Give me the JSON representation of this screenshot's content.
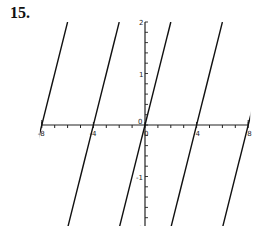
{
  "problem_number": "15.",
  "chart_data": {
    "type": "line",
    "title": "",
    "xlabel": "",
    "ylabel": "",
    "xlim": [
      -8,
      8
    ],
    "ylim": [
      -2,
      2
    ],
    "x_ticks": [
      "-8",
      "-4",
      "0",
      "4",
      "8"
    ],
    "y_ticks": [
      "2",
      "1",
      "-1",
      "-2"
    ],
    "grid": false,
    "series": [
      {
        "name": "segment-1",
        "x": [
          -10,
          -6
        ],
        "y": [
          -2,
          2
        ]
      },
      {
        "name": "segment-2",
        "x": [
          -6,
          -2
        ],
        "y": [
          -2,
          2
        ]
      },
      {
        "name": "segment-3",
        "x": [
          -2,
          2
        ],
        "y": [
          -2,
          2
        ]
      },
      {
        "name": "segment-4",
        "x": [
          2,
          6
        ],
        "y": [
          -2,
          2
        ]
      },
      {
        "name": "segment-5",
        "x": [
          6,
          10
        ],
        "y": [
          -2,
          2
        ]
      }
    ]
  }
}
